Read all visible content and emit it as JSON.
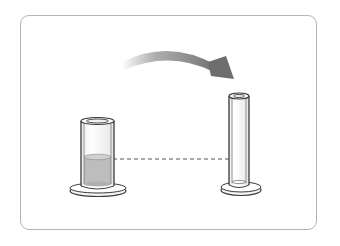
{
  "diagram": {
    "colors": {
      "frame_border": "#b4b4b4",
      "outline": "#3a3a3a",
      "liquid": "#bdbdbd",
      "liquid_top": "#d0d0d0",
      "arrow": "#7a7a7a",
      "dashed_line": "#555555",
      "glass_fill": "#f4f4f4"
    },
    "elements": [
      {
        "name": "wide-cylinder",
        "role": "source container",
        "contains_liquid": true
      },
      {
        "name": "narrow-tube",
        "role": "destination container",
        "contains_liquid": false
      },
      {
        "name": "pour-arrow",
        "direction": "left-to-right, curving down"
      },
      {
        "name": "level-dashed-line",
        "meaning": "liquid level reference"
      }
    ]
  }
}
